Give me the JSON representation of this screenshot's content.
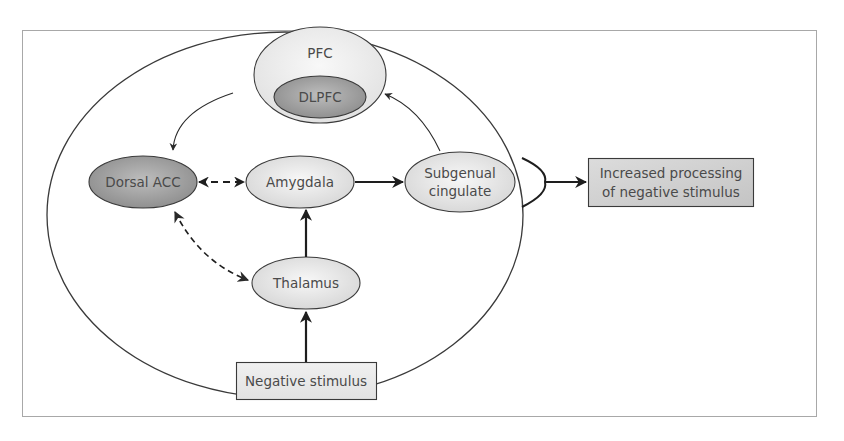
{
  "figure": {
    "frame_border_color": "#a0a0a0",
    "top_text_partial": "",
    "caption_partial": ""
  },
  "nodes": {
    "pfc": {
      "label": "PFC",
      "fill": "#ececec"
    },
    "dlpfc": {
      "label": "DLPFC",
      "fill": "#9a9a9a"
    },
    "dorsal_acc": {
      "label": "Dorsal ACC",
      "fill": "#a4a4a4"
    },
    "amygdala": {
      "label": "Amygdala",
      "fill": "#e6e6e6"
    },
    "subgenual_cingulate": {
      "line1": "Subgenual",
      "line2": "cingulate",
      "fill": "#e6e6e6"
    },
    "thalamus": {
      "label": "Thalamus",
      "fill": "#e6e6e6"
    },
    "negative_stimulus": {
      "label": "Negative stimulus",
      "fill": "#e8e8e8"
    },
    "increased_processing": {
      "line1": "Increased processing",
      "line2": "of negative stimulus",
      "fill": "#cfcfcf"
    }
  },
  "edges": [
    {
      "from": "PFC",
      "to": "Dorsal ACC",
      "style": "solid-thin",
      "directed": true
    },
    {
      "from": "Subgenual cingulate",
      "to": "PFC",
      "style": "solid-thin",
      "directed": true
    },
    {
      "from": "Dorsal ACC",
      "to": "Amygdala",
      "style": "dashed",
      "directed": "bidirectional"
    },
    {
      "from": "Amygdala",
      "to": "Subgenual cingulate",
      "style": "solid-thick",
      "directed": true
    },
    {
      "from": "Thalamus",
      "to": "Amygdala",
      "style": "solid-thick",
      "directed": true
    },
    {
      "from": "Dorsal ACC",
      "to": "Thalamus",
      "style": "dashed",
      "directed": "bidirectional"
    },
    {
      "from": "Negative stimulus",
      "to": "Thalamus",
      "style": "solid-thick",
      "directed": true
    },
    {
      "from": "Circuit",
      "to": "Increased processing of negative stimulus",
      "style": "solid-thick",
      "directed": true
    }
  ]
}
